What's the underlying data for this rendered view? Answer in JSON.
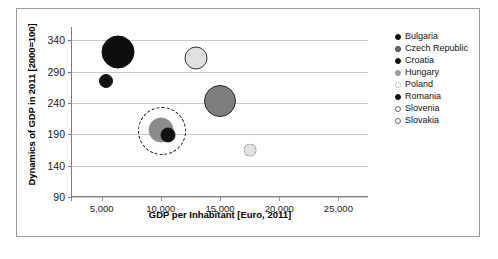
{
  "chart_data": {
    "type": "scatter",
    "title": "",
    "xlabel": "GDP per Inhabitant [Euro, 2011]",
    "ylabel": "Dynamics of GDP in 2011 [2000=100]",
    "xlim": [
      2500,
      27500
    ],
    "ylim": [
      90,
      355
    ],
    "xticks": [
      5000,
      10000,
      15000,
      20000,
      25000
    ],
    "xticklabels": [
      "5,000",
      "10,000",
      "15,000",
      "20,000",
      "25,000"
    ],
    "yticks": [
      90,
      140,
      190,
      240,
      290,
      340
    ],
    "yticklabels": [
      "90",
      "140",
      "190",
      "240",
      "290",
      "340"
    ],
    "grid": true,
    "legend_position": "right",
    "points": [
      {
        "name": "Bulgaria",
        "x": 5400,
        "y": 275,
        "size": 14,
        "fill": "#111111",
        "stroke": "#111111",
        "stroke_style": "solid"
      },
      {
        "name": "Czech Republic",
        "x": 15000,
        "y": 243,
        "size": 32,
        "fill": "#7e7e7e",
        "stroke": "#2b2b2b",
        "stroke_style": "solid"
      },
      {
        "name": "Croatia",
        "x": 10600,
        "y": 189,
        "size": 15,
        "fill": "#111111",
        "stroke": "#111111",
        "stroke_style": "solid"
      },
      {
        "name": "Hungary",
        "x": 10000,
        "y": 197,
        "size": 25,
        "fill": "#8c8c8c",
        "stroke": "#8c8c8c",
        "stroke_style": "solid"
      },
      {
        "name": "Poland",
        "x": 10100,
        "y": 196,
        "size": 48,
        "fill": "none",
        "stroke": "#111111",
        "stroke_style": "dashed"
      },
      {
        "name": "Romania",
        "x": 6350,
        "y": 322,
        "size": 33,
        "fill": "#0d0d0d",
        "stroke": "#0d0d0d",
        "stroke_style": "solid"
      },
      {
        "name": "Slovenia",
        "x": 17500,
        "y": 165,
        "size": 13,
        "fill": "#e3e3e3",
        "stroke": "#555555",
        "stroke_style": "dotted"
      },
      {
        "name": "Slovakia",
        "x": 12950,
        "y": 312,
        "size": 23,
        "fill": "#e0e0e0",
        "stroke": "#333333",
        "stroke_style": "solid"
      }
    ],
    "legend": [
      {
        "label": "Bulgaria",
        "fill": "#111111",
        "stroke": "#111111",
        "stroke_style": "solid"
      },
      {
        "label": "Czech Republic",
        "fill": "#6e6e6e",
        "stroke": "#3a3a3a",
        "stroke_style": "solid"
      },
      {
        "label": "Croatia",
        "fill": "#111111",
        "stroke": "#111111",
        "stroke_style": "solid"
      },
      {
        "label": "Hungary",
        "fill": "#9a9a9a",
        "stroke": "#9a9a9a",
        "stroke_style": "solid"
      },
      {
        "label": "Poland",
        "fill": "#ffffff",
        "stroke": "#999999",
        "stroke_style": "dotted"
      },
      {
        "label": "Romania",
        "fill": "#111111",
        "stroke": "#111111",
        "stroke_style": "solid"
      },
      {
        "label": "Slovenia",
        "fill": "#ffffff",
        "stroke": "#6b6b6b",
        "stroke_style": "solid"
      },
      {
        "label": "Slovakia",
        "fill": "#ffffff",
        "stroke": "#6b6b6b",
        "stroke_style": "solid"
      }
    ]
  },
  "caption": ""
}
